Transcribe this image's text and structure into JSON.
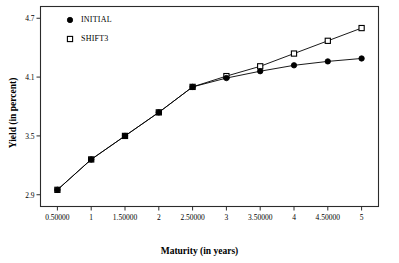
{
  "chart_data": {
    "type": "line",
    "title": "",
    "xlabel": "Maturity (in years)",
    "ylabel": "Yield (in percent)",
    "xlim": [
      0.25,
      5.25
    ],
    "ylim": [
      2.78,
      4.82
    ],
    "grid": false,
    "legend_position": "top-left",
    "x_tick_labels": [
      "0.50000",
      "1",
      "1.50000",
      "2",
      "2.50000",
      "3",
      "3.50000",
      "4",
      "4.50000",
      "5"
    ],
    "x_tick_values": [
      0.5,
      1,
      1.5,
      2,
      2.5,
      3,
      3.5,
      4,
      4.5,
      5
    ],
    "y_tick_labels": [
      "2.9",
      "3.5",
      "4.1",
      "4.7"
    ],
    "y_tick_values": [
      2.9,
      3.5,
      4.1,
      4.7
    ],
    "x": [
      0.5,
      1,
      1.5,
      2,
      2.5,
      3,
      3.5,
      4,
      4.5,
      5
    ],
    "series": [
      {
        "name": "INITIAL",
        "marker": "filled-circle",
        "color": "#000000",
        "values": [
          2.95,
          3.26,
          3.5,
          3.74,
          4.0,
          4.09,
          4.16,
          4.22,
          4.26,
          4.29
        ]
      },
      {
        "name": "SHIFT3",
        "marker": "open-square",
        "color": "#000000",
        "values": [
          2.95,
          3.26,
          3.5,
          3.74,
          4.0,
          4.11,
          4.21,
          4.34,
          4.47,
          4.6
        ]
      }
    ]
  },
  "legend": {
    "entries": [
      {
        "label": "INITIAL",
        "marker": "filled-circle"
      },
      {
        "label": "SHIFT3",
        "marker": "open-square"
      }
    ]
  }
}
